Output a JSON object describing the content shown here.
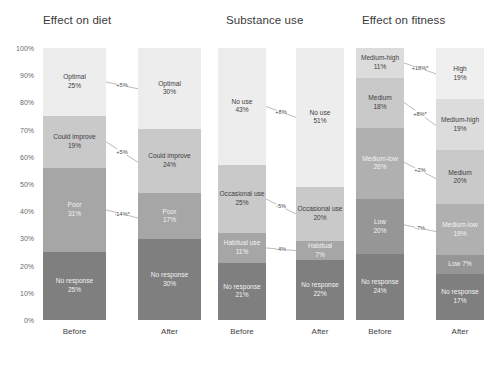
{
  "figure": {
    "background": "#ffffff",
    "category_axis": [
      "Before",
      "After"
    ]
  },
  "yaxis": {
    "ticks": [
      "100%",
      "90%",
      "80%",
      "70%",
      "60%",
      "50%",
      "40%",
      "30%",
      "20%",
      "10%",
      "0%"
    ],
    "min": 0,
    "max": 100
  },
  "chart_data": [
    {
      "type": "bar",
      "title": "Effect on diet",
      "stacked": true,
      "xlabel": "",
      "ylabel": "",
      "ylim": [
        0,
        100
      ],
      "grid": false,
      "categories": [
        "Before",
        "After"
      ],
      "series": [
        {
          "name": "No response",
          "values": [
            25,
            30
          ],
          "color": "#7f7f7f"
        },
        {
          "name": "Poor",
          "values": [
            31,
            17
          ],
          "color": "#a6a6a6"
        },
        {
          "name": "Could improve",
          "values": [
            19,
            24
          ],
          "color": "#c9c9c9"
        },
        {
          "name": "Optimal",
          "values": [
            25,
            30
          ],
          "color": "#ededed"
        }
      ],
      "bars": [
        {
          "category": "Before",
          "segments": [
            {
              "label": "Optimal",
              "value": "25%",
              "color": "#ededed",
              "text_color": "#3f3f3f"
            },
            {
              "label": "Could improve",
              "value": "19%",
              "color": "#c9c9c9",
              "text_color": "#3f3f3f"
            },
            {
              "label": "Poor",
              "value": "31%",
              "color": "#a6a6a6",
              "text_color": "#f2f2f2"
            },
            {
              "label": "No response",
              "value": "25%",
              "color": "#7f7f7f",
              "text_color": "#f2f2f2"
            }
          ]
        },
        {
          "category": "After",
          "segments": [
            {
              "label": "Optimal",
              "value": "30%",
              "color": "#ededed",
              "text_color": "#3f3f3f"
            },
            {
              "label": "Could improve",
              "value": "24%",
              "color": "#c9c9c9",
              "text_color": "#3f3f3f"
            },
            {
              "label": "Poor",
              "value": "17%",
              "color": "#a6a6a6",
              "text_color": "#f2f2f2"
            },
            {
              "label": "No response",
              "value": "30%",
              "color": "#7f7f7f",
              "text_color": "#f2f2f2"
            }
          ]
        }
      ],
      "annotations": [
        {
          "label": "+5%",
          "from_segment": "Optimal",
          "to_segment": "Optimal"
        },
        {
          "label": "+5%",
          "from_segment": "Could improve",
          "to_segment": "Could improve"
        },
        {
          "label": "-14%*",
          "from_segment": "Poor",
          "to_segment": "Poor"
        }
      ]
    },
    {
      "type": "bar",
      "title": "Substance use",
      "stacked": true,
      "xlabel": "",
      "ylabel": "",
      "ylim": [
        0,
        100
      ],
      "grid": false,
      "categories": [
        "Before",
        "After"
      ],
      "series": [
        {
          "name": "No response",
          "values": [
            21,
            22
          ],
          "color": "#7f7f7f"
        },
        {
          "name": "Habitual use",
          "values": [
            11,
            7
          ],
          "color": "#a6a6a6"
        },
        {
          "name": "Occasional use",
          "values": [
            25,
            20
          ],
          "color": "#c9c9c9"
        },
        {
          "name": "No use",
          "values": [
            43,
            51
          ],
          "color": "#ededed"
        }
      ],
      "bars": [
        {
          "category": "Before",
          "segments": [
            {
              "label": "No use",
              "value": "43%",
              "color": "#ededed",
              "text_color": "#3f3f3f"
            },
            {
              "label": "Occasional use",
              "value": "25%",
              "color": "#c9c9c9",
              "text_color": "#3f3f3f"
            },
            {
              "label": "Habitual use",
              "value": "11%",
              "color": "#a6a6a6",
              "text_color": "#f2f2f2"
            },
            {
              "label": "No response",
              "value": "21%",
              "color": "#7f7f7f",
              "text_color": "#f2f2f2"
            }
          ]
        },
        {
          "category": "After",
          "segments": [
            {
              "label": "No use",
              "value": "51%",
              "color": "#ededed",
              "text_color": "#3f3f3f"
            },
            {
              "label": "Occasional use",
              "value": "20%",
              "color": "#c9c9c9",
              "text_color": "#3f3f3f"
            },
            {
              "label": "Habitual",
              "value": "7%",
              "color": "#a6a6a6",
              "text_color": "#f2f2f2"
            },
            {
              "label": "No response",
              "value": "22%",
              "color": "#7f7f7f",
              "text_color": "#f2f2f2"
            }
          ]
        }
      ],
      "annotations": [
        {
          "label": "+8%",
          "from_segment": "No use",
          "to_segment": "No use"
        },
        {
          "label": "-5%",
          "from_segment": "Occasional use",
          "to_segment": "Occasional use"
        },
        {
          "label": "-4%",
          "from_segment": "Habitual use",
          "to_segment": "Habitual"
        }
      ]
    },
    {
      "type": "bar",
      "title": "Effect on fitness",
      "stacked": true,
      "xlabel": "",
      "ylabel": "",
      "ylim": [
        0,
        100
      ],
      "grid": false,
      "categories": [
        "Before",
        "After"
      ],
      "series": [
        {
          "name": "No response",
          "values": [
            24,
            17
          ],
          "color": "#7f7f7f"
        },
        {
          "name": "Low",
          "values": [
            20,
            7
          ],
          "color": "#969696"
        },
        {
          "name": "Medium-low",
          "values": [
            26,
            19
          ],
          "color": "#b0b0b0"
        },
        {
          "name": "Medium",
          "values": [
            18,
            20
          ],
          "color": "#c9c9c9"
        },
        {
          "name": "Medium-high",
          "values": [
            11,
            19
          ],
          "color": "#dcdcdc"
        },
        {
          "name": "High",
          "values": [
            0,
            19
          ],
          "color": "#efefef"
        }
      ],
      "bars": [
        {
          "category": "Before",
          "segments": [
            {
              "label": "Medium-high",
              "value": "11%",
              "color": "#dcdcdc",
              "text_color": "#3f3f3f"
            },
            {
              "label": "Medium",
              "value": "18%",
              "color": "#c9c9c9",
              "text_color": "#3f3f3f"
            },
            {
              "label": "Medium-low",
              "value": "26%",
              "color": "#b0b0b0",
              "text_color": "#f2f2f2"
            },
            {
              "label": "Low",
              "value": "20%",
              "color": "#969696",
              "text_color": "#f2f2f2"
            },
            {
              "label": "No response",
              "value": "24%",
              "color": "#7f7f7f",
              "text_color": "#f2f2f2"
            }
          ]
        },
        {
          "category": "After",
          "segments": [
            {
              "label": "High",
              "value": "19%",
              "color": "#efefef",
              "text_color": "#3f3f3f"
            },
            {
              "label": "Medium-high",
              "value": "19%",
              "color": "#dcdcdc",
              "text_color": "#3f3f3f"
            },
            {
              "label": "Medium",
              "value": "20%",
              "color": "#c9c9c9",
              "text_color": "#3f3f3f"
            },
            {
              "label": "Medium-low",
              "value": "19%",
              "color": "#b0b0b0",
              "text_color": "#f2f2f2"
            },
            {
              "label": "Low 7%",
              "value": "",
              "color": "#969696",
              "text_color": "#f2f2f2"
            },
            {
              "label": "No response",
              "value": "17%",
              "color": "#7f7f7f",
              "text_color": "#f2f2f2"
            }
          ]
        }
      ],
      "annotations": [
        {
          "label": "+18%*",
          "from_segment": "Medium-high",
          "to_segment": "High"
        },
        {
          "label": "+8%*",
          "from_segment": "Medium",
          "to_segment": "Medium-high"
        },
        {
          "label": "+2%",
          "from_segment": "Medium-low",
          "to_segment": "Medium"
        },
        {
          "label": "-7%",
          "from_segment": "Low",
          "to_segment": "Medium-low"
        },
        {
          "label": "-13%*",
          "from_segment": "No response",
          "to_segment": "Low"
        }
      ]
    }
  ]
}
